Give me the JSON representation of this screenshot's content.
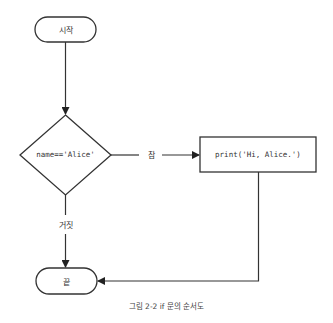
{
  "diagram": {
    "type": "flowchart",
    "nodes": {
      "start": {
        "shape": "terminal",
        "label": "시작"
      },
      "condition": {
        "shape": "decision",
        "label": "name=='Alice'"
      },
      "action": {
        "shape": "process",
        "label": "print('Hi, Alice.')"
      },
      "end": {
        "shape": "terminal",
        "label": "끝"
      }
    },
    "edges": {
      "true_label": "참",
      "false_label": "거짓"
    },
    "caption": "그림 2-2 if 문의 순서도",
    "colors": {
      "stroke": "#333333",
      "text": "#333333",
      "background": "#ffffff"
    }
  }
}
